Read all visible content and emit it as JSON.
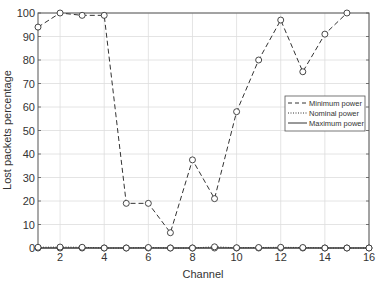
{
  "chart_data": {
    "type": "line",
    "title": "",
    "xlabel": "Channel",
    "ylabel": "Lost packets percentage",
    "xlim": [
      1,
      16
    ],
    "ylim": [
      0,
      100
    ],
    "grid": true,
    "legend_position": "right-middle",
    "x_ticks": [
      2,
      4,
      6,
      8,
      10,
      12,
      14,
      16
    ],
    "y_ticks": [
      0,
      10,
      20,
      30,
      40,
      50,
      60,
      70,
      80,
      90,
      100
    ],
    "x": [
      1,
      2,
      3,
      4,
      5,
      6,
      7,
      8,
      9,
      10,
      11,
      12,
      13,
      14,
      15,
      16
    ],
    "series": [
      {
        "name": "Minimum power",
        "line_style": "dashed",
        "marker": "circle",
        "values": [
          94,
          100,
          99,
          99,
          19,
          19,
          6.5,
          37.5,
          21,
          58,
          80,
          97,
          75,
          91,
          100,
          null
        ]
      },
      {
        "name": "Nominal power",
        "line_style": "dotted",
        "marker": "circle",
        "values": [
          0.3,
          0.4,
          0.3,
          0,
          0,
          0.2,
          0,
          0,
          0.5,
          0.1,
          0.2,
          0.3,
          0.2,
          0,
          0,
          0
        ]
      },
      {
        "name": "Maximum power",
        "line_style": "solid",
        "marker": "circle",
        "values": [
          0,
          0,
          0,
          0,
          0,
          0,
          0,
          0,
          0,
          0,
          0,
          0,
          0,
          0,
          0,
          0
        ]
      }
    ]
  },
  "colors": {
    "line": "#333333",
    "grid": "#dddddd",
    "axis": "#555555",
    "marker_fill": "#ffffff"
  }
}
